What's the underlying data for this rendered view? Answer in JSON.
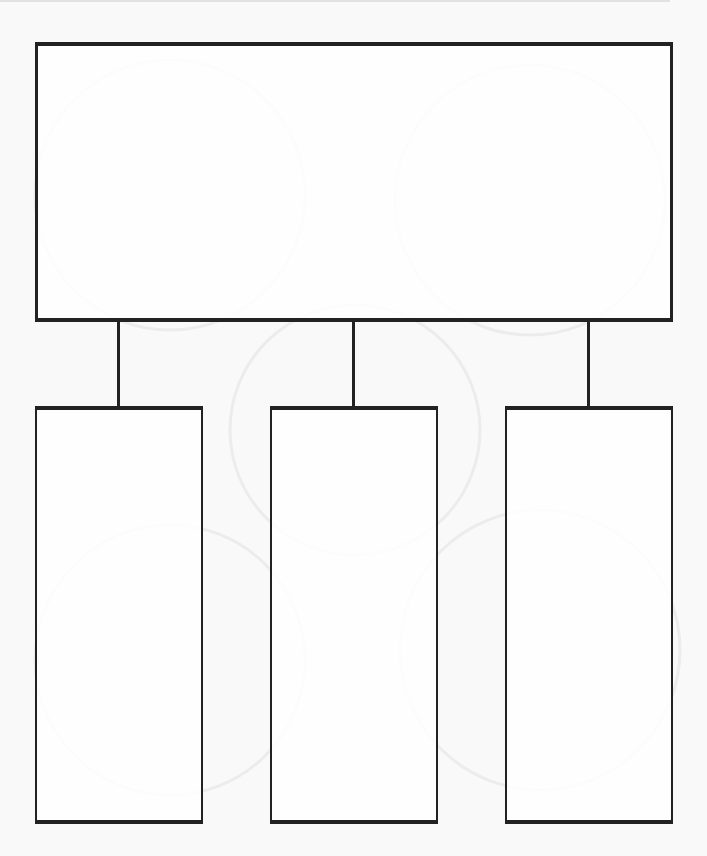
{
  "diagram": {
    "type": "hierarchy-graphic-organizer",
    "colors": {
      "background": "#f9f9f9",
      "box_fill": "#ffffff",
      "stroke": "#222222",
      "watermark": "#ececec"
    },
    "parent": {
      "label": ""
    },
    "children": [
      {
        "label": ""
      },
      {
        "label": ""
      },
      {
        "label": ""
      }
    ],
    "connectors": 3
  }
}
